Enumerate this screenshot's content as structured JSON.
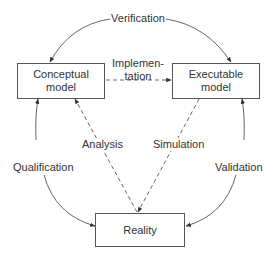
{
  "diagram": {
    "nodes": {
      "conceptual": {
        "line1": "Conceptual",
        "line2": "model"
      },
      "executable": {
        "line1": "Executable",
        "line2": "model"
      },
      "reality": {
        "label": "Reality"
      }
    },
    "edges": {
      "verification": {
        "label": "Verification",
        "from": "Conceptual model / Executable model",
        "style": "solid"
      },
      "implementation": {
        "line1": "Implemen-",
        "line2": "tation",
        "from": "Conceptual model",
        "to": "Executable model",
        "style": "dashed"
      },
      "analysis": {
        "label": "Analysis",
        "from": "Reality",
        "to": "Conceptual model",
        "style": "dashed"
      },
      "simulation": {
        "label": "Simulation",
        "from": "Executable model",
        "to": "Reality",
        "style": "dashed"
      },
      "qualification": {
        "label": "Qualification",
        "from": "Conceptual model / Reality",
        "style": "solid"
      },
      "validation": {
        "label": "Validation",
        "from": "Executable model / Reality",
        "style": "solid"
      }
    }
  }
}
